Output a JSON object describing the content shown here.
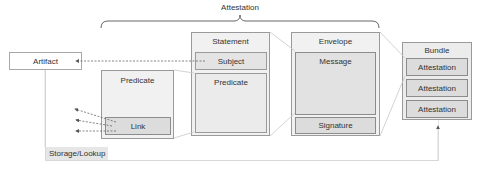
{
  "diagram": {
    "title": "Attestation",
    "artifact": {
      "label": "Artifact"
    },
    "standalone_predicate": {
      "label": "Predicate",
      "link_label": "Link"
    },
    "statement": {
      "label": "Statement",
      "subject_label": "Subject",
      "predicate_label": "Predicate"
    },
    "envelope": {
      "label": "Envelope",
      "message_label": "Message",
      "signature_label": "Signature"
    },
    "bundle": {
      "label": "Bundle",
      "items": [
        {
          "label": "Attestation"
        },
        {
          "label": "Attestation"
        },
        {
          "label": "Attestation"
        }
      ]
    },
    "storage": {
      "label": "Storage/Lookup"
    },
    "colors": {
      "box_fill": "#f1f1f1",
      "inner_fill": "#dcdcdc",
      "border": "#9a9a9a",
      "connector": "#c8c8c8",
      "arrow": "#555555"
    }
  }
}
